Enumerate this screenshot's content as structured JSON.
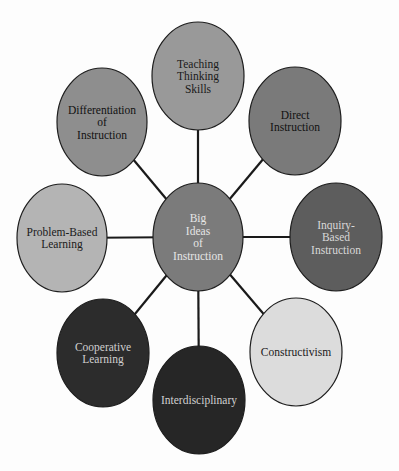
{
  "diagram": {
    "type": "concept-map",
    "center": {
      "id": "big-ideas",
      "lines": [
        "Big",
        "Ideas",
        "of",
        "Instruction"
      ],
      "cx": 198,
      "cy": 237,
      "rx": 45,
      "ry": 54,
      "fill": "#7b7b7b",
      "text_color": "#e6e6e6"
    },
    "nodes": [
      {
        "id": "teaching-thinking-skills",
        "lines": [
          "Teaching",
          "Thinking",
          "Skills"
        ],
        "cx": 198,
        "cy": 76,
        "rx": 46,
        "ry": 54,
        "fill": "#999999",
        "text_color": "#1a1a1a"
      },
      {
        "id": "direct-instruction",
        "lines": [
          "Direct",
          "Instruction"
        ],
        "cx": 295,
        "cy": 121,
        "rx": 46,
        "ry": 54,
        "fill": "#7a7a7a",
        "text_color": "#111111"
      },
      {
        "id": "inquiry-based-instruction",
        "lines": [
          "Inquiry-",
          "Based",
          "Instruction"
        ],
        "cx": 336,
        "cy": 237,
        "rx": 46,
        "ry": 54,
        "fill": "#5d5d5d",
        "text_color": "#d8d8d8"
      },
      {
        "id": "constructivism",
        "lines": [
          "Constructivism"
        ],
        "cx": 296,
        "cy": 352,
        "rx": 46,
        "ry": 54,
        "fill": "#dcdcdc",
        "text_color": "#1a1a1a"
      },
      {
        "id": "interdisciplinary",
        "lines": [
          "Interdisciplinary"
        ],
        "cx": 199,
        "cy": 400,
        "rx": 46,
        "ry": 54,
        "fill": "#262626",
        "text_color": "#d0d0d0"
      },
      {
        "id": "cooperative-learning",
        "lines": [
          "Cooperative",
          "Learning"
        ],
        "cx": 103,
        "cy": 353,
        "rx": 46,
        "ry": 54,
        "fill": "#2c2c2c",
        "text_color": "#cfcfcf"
      },
      {
        "id": "problem-based-learning",
        "lines": [
          "Problem-Based",
          "Learning"
        ],
        "cx": 62,
        "cy": 238,
        "rx": 45,
        "ry": 54,
        "fill": "#b4b4b4",
        "text_color": "#1a1a1a"
      },
      {
        "id": "differentiation-of-instruction",
        "lines": [
          "Differentiation",
          "of",
          "Instruction"
        ],
        "cx": 102,
        "cy": 122,
        "rx": 45,
        "ry": 54,
        "fill": "#8e8e8e",
        "text_color": "#111111"
      }
    ],
    "edges": [
      {
        "from": "big-ideas",
        "to": "teaching-thinking-skills"
      },
      {
        "from": "big-ideas",
        "to": "direct-instruction"
      },
      {
        "from": "big-ideas",
        "to": "inquiry-based-instruction"
      },
      {
        "from": "big-ideas",
        "to": "constructivism"
      },
      {
        "from": "big-ideas",
        "to": "interdisciplinary"
      },
      {
        "from": "big-ideas",
        "to": "cooperative-learning"
      },
      {
        "from": "big-ideas",
        "to": "problem-based-learning"
      },
      {
        "from": "big-ideas",
        "to": "differentiation-of-instruction"
      }
    ]
  }
}
